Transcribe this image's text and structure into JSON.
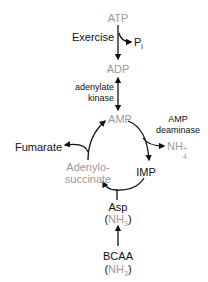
{
  "diagram": {
    "type": "biochemical-pathway",
    "colors": {
      "metabolite_gray": "#9a9a9a",
      "text_black": "#111111",
      "arrow": "#111111"
    },
    "nodes": {
      "atp": "ATP",
      "exercise": "Exercise",
      "pi": "P",
      "pi_sub": "i",
      "adp": "ADP",
      "adenylate_kinase_1": "adenylate",
      "adenylate_kinase_2": "kinase",
      "amp": "AMP",
      "amp_deaminase_1": "AMP",
      "amp_deaminase_2": "deaminase",
      "nh4": "NH",
      "nh4_sub": "4",
      "nh4_sup": "+",
      "imp": "IMP",
      "fumarate": "Fumarate",
      "adenylosuccinate_1": "Adenylo-",
      "adenylosuccinate_2": "succinate",
      "asp": "Asp",
      "asp_nh3": "NH",
      "asp_nh3_sub": "3",
      "bcaa": "BCAA",
      "bcaa_nh3": "NH",
      "bcaa_nh3_sub": "3",
      "paren_open": "(",
      "paren_close": ")"
    },
    "edges": [
      {
        "from": "ATP",
        "to": "ADP",
        "label": "Exercise",
        "side_product": "Pi"
      },
      {
        "from": "ADP",
        "to": "AMP",
        "label": "adenylate kinase",
        "bidirectional": true
      },
      {
        "from": "AMP",
        "to": "IMP",
        "label": "AMP deaminase",
        "side_product": "NH4+"
      },
      {
        "from": "IMP",
        "to": "Adenylosuccinate",
        "co_substrate": "Asp"
      },
      {
        "from": "Adenylosuccinate",
        "to": "AMP",
        "side_product": "Fumarate"
      },
      {
        "from": "BCAA",
        "to": "Asp"
      }
    ]
  }
}
